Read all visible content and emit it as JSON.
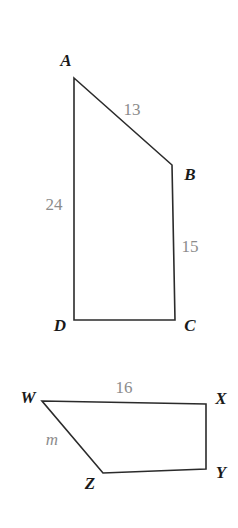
{
  "figure": {
    "background_color": "#ffffff",
    "stroke_color": "#2b2b2b",
    "vertex_label_color": "#1a1a1a",
    "measure_label_color": "#8c8c8c",
    "shapes": [
      {
        "name": "quadrilateral-abcd",
        "vertices": [
          {
            "label": "A",
            "x": 74,
            "y": 78
          },
          {
            "label": "B",
            "x": 172,
            "y": 165
          },
          {
            "label": "C",
            "x": 175,
            "y": 320
          },
          {
            "label": "D",
            "x": 74,
            "y": 320
          }
        ],
        "side_labels": [
          {
            "name": "side-ab",
            "text": "13"
          },
          {
            "name": "side-bc",
            "text": "15"
          },
          {
            "name": "side-ad",
            "text": "24"
          }
        ]
      },
      {
        "name": "quadrilateral-wxyz",
        "vertices": [
          {
            "label": "W",
            "x": 42,
            "y": 401
          },
          {
            "label": "X",
            "x": 206,
            "y": 404
          },
          {
            "label": "Y",
            "x": 206,
            "y": 469
          },
          {
            "label": "Z",
            "x": 103,
            "y": 473
          }
        ],
        "side_labels": [
          {
            "name": "side-wx",
            "text": "16"
          },
          {
            "name": "side-wz",
            "text": "m"
          }
        ]
      }
    ],
    "labels": {
      "vertex_a": "A",
      "vertex_b": "B",
      "vertex_c": "C",
      "vertex_d": "D",
      "vertex_w": "W",
      "vertex_x": "X",
      "vertex_y": "Y",
      "vertex_z": "Z",
      "measure_ab": "13",
      "measure_bc": "15",
      "measure_ad": "24",
      "measure_wx": "16",
      "measure_wz": "m"
    }
  }
}
